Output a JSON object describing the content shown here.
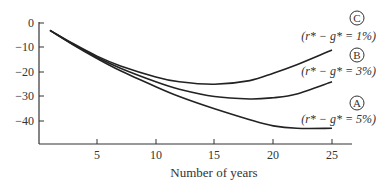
{
  "chart_data": {
    "type": "line",
    "title": "",
    "xlabel": "Number of years",
    "ylabel": "",
    "x_ticks": [
      5,
      10,
      15,
      20,
      25
    ],
    "y_ticks": [
      0,
      -10,
      -20,
      -30,
      -40
    ],
    "xlim": [
      0,
      27
    ],
    "ylim": [
      -48,
      2
    ],
    "grid": false,
    "x": [
      1,
      3,
      5,
      7,
      10,
      12,
      15,
      18,
      20,
      22,
      25
    ],
    "series": [
      {
        "name": "C",
        "annotation": "(r* − g* = 1%)",
        "values": [
          -3,
          -8.5,
          -13.5,
          -17.5,
          -22,
          -24,
          -25,
          -23.5,
          -20.5,
          -17,
          -11
        ]
      },
      {
        "name": "B",
        "annotation": "(r* − g* = 3%)",
        "values": [
          -3,
          -8.8,
          -14,
          -18.5,
          -24,
          -27,
          -30,
          -31,
          -30.5,
          -29,
          -24
        ]
      },
      {
        "name": "A",
        "annotation": "(r* − g* = 5%)",
        "values": [
          -3,
          -9,
          -14.5,
          -19.5,
          -26,
          -30,
          -35,
          -39.5,
          -42,
          -43,
          -43
        ]
      }
    ],
    "labels": {
      "C": "C",
      "B": "B",
      "A": "A",
      "C_note": "(r* − g* = 1%)",
      "B_note": "(r* − g* = 3%)",
      "A_note": "(r* − g* = 5%)"
    },
    "tick_text": {
      "x": [
        "5",
        "10",
        "15",
        "20",
        "25"
      ],
      "y": [
        "0",
        "−10",
        "−20",
        "−30",
        "−40"
      ]
    }
  }
}
